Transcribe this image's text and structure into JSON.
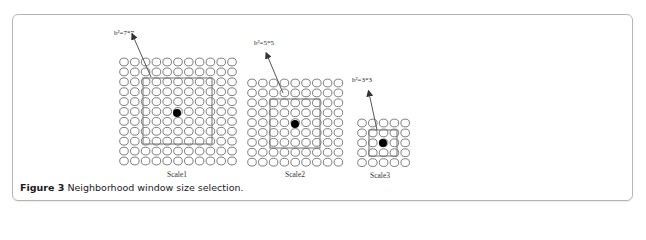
{
  "figure": {
    "number_label": "Figure 3",
    "caption_text": "Neighborhood window size selection.",
    "scales": [
      {
        "name": "Scale1",
        "grid": {
          "cols": 11,
          "rows": 11,
          "x0": 124,
          "y0": 62,
          "dx": 10.8,
          "dy": 9.9
        },
        "window_label": "b²=7*7",
        "window": {
          "size": 7,
          "x": 143,
          "y": 78,
          "w": 69,
          "h": 66
        },
        "center_dot": {
          "x": 177,
          "y": 113
        },
        "label_pos": {
          "x": 167,
          "y": 177
        },
        "window_label_pos": {
          "x": 114,
          "y": 35
        },
        "arrow": {
          "x1": 151,
          "y1": 77,
          "x2": 133,
          "y2": 36
        }
      },
      {
        "name": "Scale2",
        "grid": {
          "cols": 9,
          "rows": 9,
          "x0": 252,
          "y0": 83,
          "dx": 10.8,
          "dy": 9.9
        },
        "window_label": "b²=5*5",
        "window": {
          "size": 5,
          "x": 270,
          "y": 99,
          "w": 50,
          "h": 49
        },
        "center_dot": {
          "x": 295,
          "y": 124
        },
        "label_pos": {
          "x": 285,
          "y": 177
        },
        "window_label_pos": {
          "x": 254,
          "y": 45
        },
        "arrow": {
          "x1": 283,
          "y1": 93,
          "x2": 267,
          "y2": 55
        }
      },
      {
        "name": "Scale3",
        "grid": {
          "cols": 5,
          "rows": 5,
          "x0": 362,
          "y0": 123,
          "dx": 10.8,
          "dy": 9.9
        },
        "window_label": "b²=3*3",
        "window": {
          "size": 3,
          "x": 369,
          "y": 130,
          "w": 28,
          "h": 26
        },
        "center_dot": {
          "x": 383,
          "y": 143
        },
        "label_pos": {
          "x": 370,
          "y": 178
        },
        "window_label_pos": {
          "x": 352,
          "y": 82
        },
        "arrow": {
          "x1": 377,
          "y1": 130,
          "x2": 369,
          "y2": 93
        }
      }
    ],
    "colors": {
      "circle_stroke": "#6e6e6e",
      "window_stroke": "#707070",
      "dot_fill": "#000000",
      "arrow": "#555555",
      "border": "#b5b5b5"
    }
  }
}
